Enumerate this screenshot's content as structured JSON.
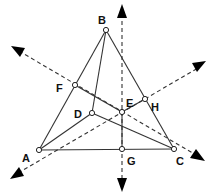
{
  "diagram": {
    "type": "geometry-construction",
    "points": [
      {
        "id": "A",
        "label": "A",
        "x": 39,
        "y": 150,
        "lx": 22,
        "ly": 160
      },
      {
        "id": "B",
        "label": "B",
        "x": 106,
        "y": 30,
        "lx": 98,
        "ly": 24
      },
      {
        "id": "C",
        "label": "C",
        "x": 174,
        "y": 149,
        "lx": 176,
        "ly": 163
      },
      {
        "id": "D",
        "label": "D",
        "x": 92,
        "y": 113,
        "lx": 74,
        "ly": 116
      },
      {
        "id": "E",
        "label": "E",
        "x": 122,
        "y": 112,
        "lx": 126,
        "ly": 106
      },
      {
        "id": "F",
        "label": "F",
        "x": 75,
        "y": 85,
        "lx": 56,
        "ly": 90
      },
      {
        "id": "G",
        "label": "G",
        "x": 122,
        "y": 149,
        "lx": 127,
        "ly": 165
      },
      {
        "id": "H",
        "label": "H",
        "x": 145,
        "y": 99,
        "lx": 150,
        "ly": 110
      }
    ],
    "solid_segments": [
      [
        "A",
        "B"
      ],
      [
        "B",
        "C"
      ],
      [
        "A",
        "C"
      ],
      [
        "B",
        "D"
      ],
      [
        "A",
        "D"
      ],
      [
        "D",
        "C"
      ],
      [
        "F",
        "E"
      ],
      [
        "E",
        "H"
      ],
      [
        "E",
        "G"
      ],
      [
        "F",
        "C"
      ]
    ],
    "dashed_lines": [
      {
        "name": "vertical-bisector",
        "x1": 122,
        "y1": 8,
        "x2": 122,
        "y2": 188
      },
      {
        "name": "bisector-through-F",
        "x1": 14,
        "y1": 48,
        "x2": 201,
        "y2": 158
      },
      {
        "name": "bisector-through-H",
        "x1": 13,
        "y1": 176,
        "x2": 203,
        "y2": 65
      }
    ]
  }
}
